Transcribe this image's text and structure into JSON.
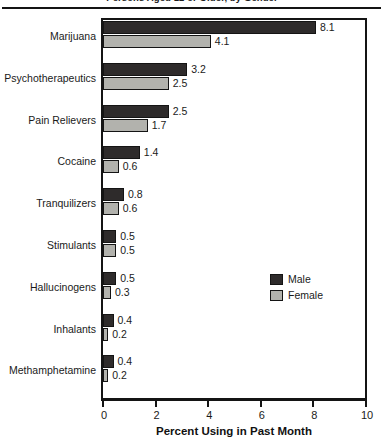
{
  "chart_data": {
    "type": "bar",
    "orientation": "horizontal",
    "title": "Persons Aged 12 or Older, by Gender",
    "xlabel": "Percent Using in Past Month",
    "ylabel": "",
    "xlim": [
      0,
      10
    ],
    "xticks": [
      0,
      2,
      4,
      6,
      8,
      10
    ],
    "grid": false,
    "legend_position": "middle-right",
    "categories": [
      "Marijuana",
      "Psychotherapeutics",
      "Pain Relievers",
      "Cocaine",
      "Tranquilizers",
      "Stimulants",
      "Hallucinogens",
      "Inhalants",
      "Methamphetamine"
    ],
    "series": [
      {
        "name": "Male",
        "color": "#2e2b2b",
        "values": [
          8.1,
          3.2,
          2.5,
          1.4,
          0.8,
          0.5,
          0.5,
          0.4,
          0.4
        ]
      },
      {
        "name": "Female",
        "color": "#b2b2ad",
        "values": [
          4.1,
          2.5,
          1.7,
          0.6,
          0.6,
          0.5,
          0.3,
          0.2,
          0.2
        ]
      }
    ],
    "value_labels": [
      {
        "category": "Marijuana",
        "male": "8.1",
        "female": "4.1"
      },
      {
        "category": "Psychotherapeutics",
        "male": "3.2",
        "female": "2.5"
      },
      {
        "category": "Pain Relievers",
        "male": "2.5",
        "female": "1.7"
      },
      {
        "category": "Cocaine",
        "male": "1.4",
        "female": "0.6"
      },
      {
        "category": "Tranquilizers",
        "male": "0.8",
        "female": "0.6"
      },
      {
        "category": "Stimulants",
        "male": "0.5",
        "female": "0.5"
      },
      {
        "category": "Hallucinogens",
        "male": "0.5",
        "female": "0.3"
      },
      {
        "category": "Inhalants",
        "male": "0.4",
        "female": "0.2"
      },
      {
        "category": "Methamphetamine",
        "male": "0.4",
        "female": "0.2"
      }
    ]
  },
  "legend": {
    "items": [
      {
        "label": "Male",
        "color": "#2e2b2b"
      },
      {
        "label": "Female",
        "color": "#b2b2ad"
      }
    ]
  },
  "axis": {
    "x_title": "Percent Using in Past Month",
    "x_tick_labels": [
      "0",
      "2",
      "4",
      "6",
      "8",
      "10"
    ]
  }
}
